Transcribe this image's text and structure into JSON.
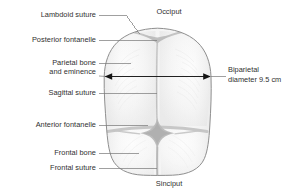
{
  "figure": {
    "colors": {
      "outline": "#8f8f8f",
      "bone_fill": "#f4f4f4",
      "bone_fill_alt": "#efefef",
      "suture_gray": "#c9c9c9",
      "fontanelle_gray": "#bdbdbd",
      "leader_line": "#6e6e6e",
      "arrow": "#1a1a1a",
      "text": "#2f2f2f",
      "background": "#ffffff"
    }
  },
  "labels": {
    "lambdoid_suture": "Lambdoid suture",
    "posterior_fontanelle": "Posterior fontanelle",
    "parietal_bone_line1": "Parietal bone",
    "parietal_bone_line2": "and eminence",
    "sagittal_suture": "Sagittal suture",
    "anterior_fontanelle": "Anterior fontanelle",
    "frontal_bone": "Frontal bone",
    "frontal_suture": "Frontal suture",
    "occiput": "Occiput",
    "sinciput": "Sinciput",
    "biparietal_line1": "Biparietal",
    "biparietal_line2": "diameter 9.5 cm"
  },
  "measurements": {
    "biparietal_diameter_value": "9.5",
    "biparietal_diameter_unit": "cm",
    "biparietal_diameter_text": "diameter 9.5 cm"
  },
  "anatomy_parts": [
    "Lambdoid suture",
    "Posterior fontanelle",
    "Parietal bone and eminence",
    "Sagittal suture",
    "Anterior fontanelle",
    "Frontal bone",
    "Frontal suture",
    "Occiput",
    "Sinciput"
  ]
}
